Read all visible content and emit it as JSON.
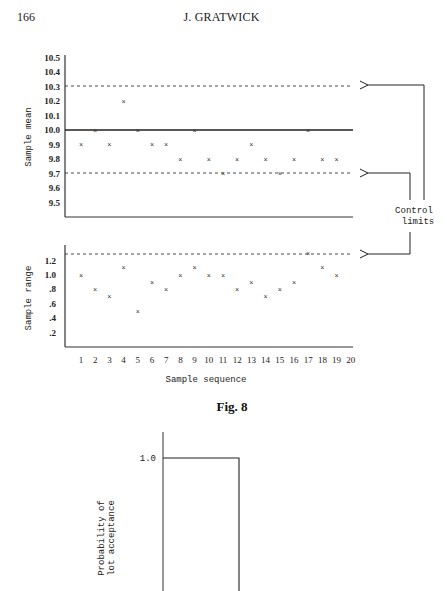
{
  "header": {
    "page_number": "166",
    "running_head": "J. GRATWICK"
  },
  "figure": {
    "caption": "Fig. 8",
    "annotation": [
      "Control",
      "limits"
    ]
  },
  "chart_data": [
    {
      "type": "scatter",
      "title": "Sample mean control chart",
      "xlabel": "",
      "ylabel": "Sample mean",
      "ylim": [
        9.4,
        10.5
      ],
      "yticks": [
        "10.5",
        "10.4",
        "10.3",
        "10.2",
        "10.1",
        "10.0",
        "9.9",
        "9.8",
        "9.7",
        "9.6",
        "9.5"
      ],
      "x": [
        1,
        2,
        3,
        4,
        5,
        6,
        7,
        8,
        9,
        10,
        11,
        12,
        13,
        14,
        15,
        16,
        17,
        18,
        19
      ],
      "values": [
        9.9,
        10.0,
        9.9,
        10.2,
        10.0,
        9.9,
        9.9,
        9.8,
        10.0,
        9.8,
        9.7,
        9.8,
        9.9,
        9.8,
        9.7,
        9.8,
        10.0,
        9.8,
        9.8
      ],
      "marker": "x",
      "center_line": 10.0,
      "upper_control_limit": 10.28,
      "lower_control_limit": 9.7,
      "grid": false
    },
    {
      "type": "scatter",
      "title": "Sample range control chart",
      "xlabel": "Sample sequence",
      "ylabel": "Sample range",
      "ylim": [
        0,
        1.4
      ],
      "yticks": [
        "1.2",
        "1.0",
        ".8",
        ".6",
        ".4",
        ".2"
      ],
      "xticks": [
        "1",
        "2",
        "3",
        "4",
        "5",
        "6",
        "7",
        "8",
        "9",
        "10",
        "11",
        "12",
        "13",
        "14",
        "15",
        "16",
        "17",
        "18",
        "19",
        "20"
      ],
      "x": [
        1,
        2,
        3,
        4,
        5,
        6,
        7,
        8,
        9,
        10,
        11,
        12,
        13,
        14,
        15,
        16,
        17,
        18,
        19
      ],
      "values": [
        1.0,
        0.8,
        0.7,
        1.1,
        0.5,
        0.9,
        0.8,
        1.0,
        1.1,
        1.0,
        1.0,
        0.8,
        0.9,
        0.7,
        0.8,
        0.9,
        1.3,
        1.1,
        1.0
      ],
      "marker": "x",
      "upper_control_limit": 1.3,
      "grid": false
    },
    {
      "type": "line",
      "title": "Ideal operating characteristic curve",
      "xlabel": "",
      "ylabel": "Probability of lot acceptance",
      "yticks": [
        "1.0"
      ],
      "description": "Step function: probability 1.0 up to a cutoff, then drops vertically",
      "grid": false
    }
  ]
}
